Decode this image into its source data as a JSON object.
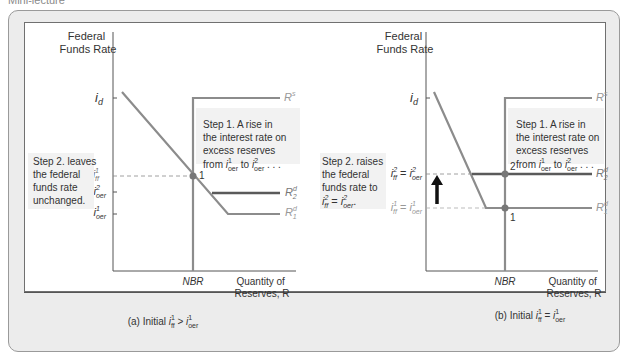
{
  "page": {
    "top_caption": "Mini-lecture"
  },
  "panel_a": {
    "y_axis_title_line1": "Federal",
    "y_axis_title_line2": "Funds Rate",
    "tick_id": "i",
    "tick_id_sub": "d",
    "tick_iff1": "i",
    "tick_iff1_sup": "1",
    "tick_iff1_sub": "ff",
    "tick_ioer2": "i",
    "tick_ioer2_sup": "2",
    "tick_ioer2_sub": "oer",
    "tick_ioer1": "i",
    "tick_ioer1_sup": "1",
    "tick_ioer1_sub": "oer",
    "curve_rs": "R",
    "curve_rs_sup": "s",
    "curve_rd2": "R",
    "curve_rd2_sup": "d",
    "curve_rd2_sub": "2",
    "curve_rd1": "R",
    "curve_rd1_sup": "d",
    "curve_rd1_sub": "1",
    "point1": "1",
    "step1_line1": "Step 1. A rise in",
    "step1_line2": "the interest rate on",
    "step1_line3": "excess reserves",
    "step1_line4_from": "from ",
    "step1_line4_to": " to ",
    "step1_line4_end": " . . .",
    "step2_line1": "Step 2. leaves",
    "step2_line2": "the federal",
    "step2_line3": "funds rate",
    "step2_line4": "unchanged.",
    "x_tick_nbr": "NBR",
    "x_axis_title_line1": "Quantity of",
    "x_axis_title_line2": "Reserves, R",
    "caption_prefix": "(a) Initial ",
    "caption_op": " > "
  },
  "panel_b": {
    "y_axis_title_line1": "Federal",
    "y_axis_title_line2": "Funds Rate",
    "tick_id": "i",
    "tick_id_sub": "d",
    "tick_iff2_eq": " = ",
    "tick_iff1_eq": " = ",
    "curve_rs": "R",
    "curve_rs_sup": "s",
    "curve_rd2": "R",
    "curve_rd2_sup": "d",
    "curve_rd2_sub": "2",
    "curve_rd1": "R",
    "curve_rd1_sup": "d",
    "curve_rd1_sub": "1",
    "point1": "1",
    "point2": "2",
    "step1_line1": "Step 1. A rise in",
    "step1_line2": "the interest rate on",
    "step1_line3": "excess reserves",
    "step1_line4_from": "from ",
    "step1_line4_to": " to ",
    "step1_line4_end": " . . .",
    "step2_line1": "Step 2. raises",
    "step2_line2": "the federal",
    "step2_line3": "funds rate to",
    "step2_line4_end": ".",
    "x_tick_nbr": "NBR",
    "x_axis_title_line1": "Quantity of",
    "x_axis_title_line2": "Reserves, R",
    "caption_prefix": "(b) Initial ",
    "caption_op": " = "
  },
  "colors": {
    "curve": "#8c8c8c",
    "curve_dark": "#5a5a5a",
    "axis": "#555555",
    "callout_bg": "#f2f2f2",
    "arrow": "#111111"
  }
}
